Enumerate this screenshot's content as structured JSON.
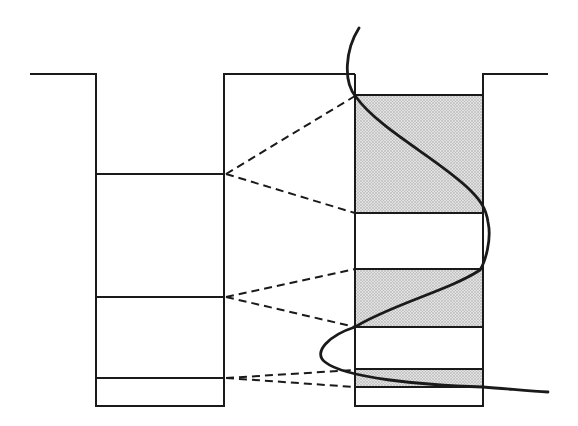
{
  "diagram": {
    "colors": {
      "line": "#1a1a1a",
      "shade": "#d4d4d4",
      "background": "#ffffff"
    },
    "left_well": {
      "barrier_y": 74,
      "left_wall_x": 96,
      "right_wall_x": 224,
      "bottom_y": 406,
      "levels_y": [
        174,
        297,
        378
      ]
    },
    "right_well": {
      "left_wall_x": 355,
      "right_wall_x": 483,
      "barrier_top_y": 74,
      "bands": [
        {
          "top": 95,
          "bottom": 213,
          "shaded": true
        },
        {
          "top": 213,
          "bottom": 269,
          "shaded": false
        },
        {
          "top": 269,
          "bottom": 327,
          "shaded": true
        },
        {
          "top": 327,
          "bottom": 369,
          "shaded": false
        },
        {
          "top": 369,
          "bottom": 387,
          "shaded": true
        },
        {
          "top": 387,
          "bottom": 406,
          "shaded": false
        }
      ]
    },
    "connectors": [
      {
        "from_y": 174,
        "to_y": [
          95,
          213
        ]
      },
      {
        "from_y": 297,
        "to_y": [
          269,
          327
        ]
      },
      {
        "from_y": 378,
        "to_y": [
          369,
          387
        ]
      }
    ]
  }
}
